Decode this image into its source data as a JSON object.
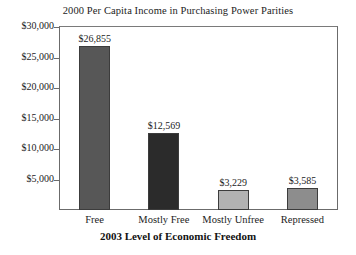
{
  "chart_data": {
    "type": "bar",
    "title": "2000 Per Capita Income in Purchasing Power Parities",
    "xlabel": "2003 Level of Economic Freedom",
    "ylabel": "",
    "categories": [
      "Free",
      "Mostly Free",
      "Mostly Unfree",
      "Repressed"
    ],
    "values": [
      26855,
      12569,
      3229,
      3585
    ],
    "value_labels": [
      "$26,855",
      "$12,569",
      "$3,229",
      "$3,585"
    ],
    "ylim": [
      0,
      30000
    ],
    "ytick_values": [
      5000,
      10000,
      15000,
      20000,
      25000,
      30000
    ],
    "ytick_labels": [
      "$5,000",
      "$10,000",
      "$15,000",
      "$20,000",
      "$25,000",
      "$30,000"
    ],
    "grid": false,
    "legend": false,
    "bar_colors": [
      "#575757",
      "#2b2b2b",
      "#b2b2b2",
      "#8d8d8d"
    ],
    "bar_border_color": "#3c3c3c",
    "frame_color": "#6b6b6b",
    "background": "#ffffff"
  }
}
